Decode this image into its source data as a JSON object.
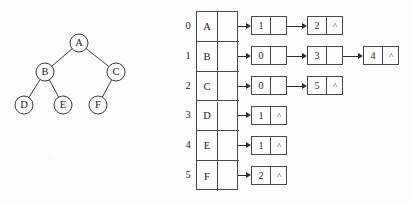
{
  "figure": {
    "kind": "graph-adjacency-list-diagram",
    "background_color": "#fdfdfd",
    "ink_color": "#2d2d2d"
  },
  "tree": {
    "nodes": [
      {
        "id": "A",
        "label": "A",
        "cx": 79,
        "cy": 43,
        "r": 9
      },
      {
        "id": "B",
        "label": "B",
        "cx": 45,
        "cy": 72,
        "r": 9
      },
      {
        "id": "C",
        "label": "C",
        "cx": 116,
        "cy": 72,
        "r": 9
      },
      {
        "id": "D",
        "label": "D",
        "cx": 24,
        "cy": 105,
        "r": 9
      },
      {
        "id": "E",
        "label": "E",
        "cx": 63,
        "cy": 105,
        "r": 9
      },
      {
        "id": "F",
        "label": "F",
        "cx": 98,
        "cy": 105,
        "r": 9
      }
    ],
    "edges": [
      {
        "from": "A",
        "to": "B"
      },
      {
        "from": "A",
        "to": "C"
      },
      {
        "from": "B",
        "to": "D"
      },
      {
        "from": "B",
        "to": "E"
      },
      {
        "from": "C",
        "to": "F"
      }
    ]
  },
  "adjacency": {
    "nil_symbol": "^",
    "rows": [
      {
        "index": "0",
        "vertex": "A",
        "nodes": [
          {
            "value": "1",
            "next": "ptr"
          },
          {
            "value": "2",
            "next": "^"
          }
        ]
      },
      {
        "index": "1",
        "vertex": "B",
        "nodes": [
          {
            "value": "0",
            "next": "ptr"
          },
          {
            "value": "3",
            "next": "ptr"
          },
          {
            "value": "4",
            "next": "^"
          }
        ]
      },
      {
        "index": "2",
        "vertex": "C",
        "nodes": [
          {
            "value": "0",
            "next": "ptr"
          },
          {
            "value": "5",
            "next": "^"
          }
        ]
      },
      {
        "index": "3",
        "vertex": "D",
        "nodes": [
          {
            "value": "1",
            "next": "^"
          }
        ]
      },
      {
        "index": "4",
        "vertex": "E",
        "nodes": [
          {
            "value": "1",
            "next": "^"
          }
        ]
      },
      {
        "index": "5",
        "vertex": "F",
        "nodes": [
          {
            "value": "2",
            "next": "^"
          }
        ]
      }
    ]
  }
}
